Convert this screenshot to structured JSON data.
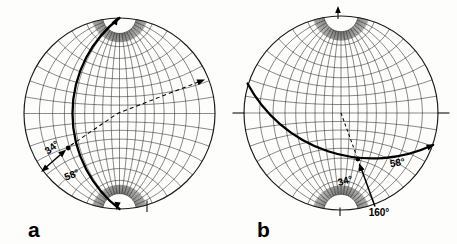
{
  "figure": {
    "panel_a": {
      "label": "a",
      "annotations": {
        "plunge": "34°",
        "dip": "58°"
      }
    },
    "panel_b": {
      "label": "b",
      "annotations": {
        "plunge": "34°",
        "dip": "58°",
        "trend": "160°"
      }
    }
  }
}
